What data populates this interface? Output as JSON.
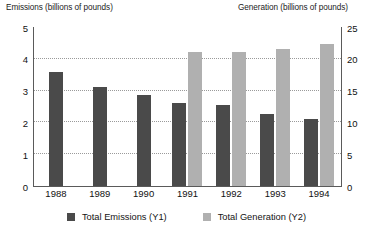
{
  "chart_data": {
    "type": "bar",
    "title": "",
    "subtitle": "",
    "categories": [
      "1988",
      "1989",
      "1990",
      "1991",
      "1992",
      "1993",
      "1994"
    ],
    "series": [
      {
        "name": "Total Emissions (Y1)",
        "axis": "left",
        "color": "#4a4a4a",
        "values": [
          3.6,
          3.1,
          2.85,
          2.6,
          2.55,
          2.25,
          2.1
        ]
      },
      {
        "name": "Total Generation (Y2)",
        "axis": "right",
        "color": "#b0b0b0",
        "values": [
          null,
          null,
          null,
          21,
          21,
          21.5,
          22.3
        ]
      }
    ],
    "xlabel": "",
    "ylabel": "Emissions (billions of pounds)",
    "y2label": "Generation (billions of pounds)",
    "ylim": [
      0,
      5
    ],
    "y2lim": [
      0,
      25
    ],
    "yticks": [
      "0",
      "1",
      "2",
      "3",
      "4",
      "5"
    ],
    "y2ticks": [
      "0",
      "5",
      "10",
      "15",
      "20",
      "25"
    ],
    "grid": true,
    "grid_style": "dotted",
    "legend_position": "bottom"
  },
  "axes": {
    "left_title": "Emissions (billions of pounds)",
    "right_title": "Generation (billions of pounds)"
  },
  "legend": {
    "entries": [
      {
        "label": "Total Emissions (Y1)",
        "color": "#4a4a4a"
      },
      {
        "label": "Total Generation (Y2)",
        "color": "#b0b0b0"
      }
    ]
  },
  "colors": {
    "emissions": "#4a4a4a",
    "generation": "#b0b0b0",
    "gridline": "#9a9a9a",
    "axis": "#5a5a5a",
    "text": "#111111",
    "background": "#ffffff"
  }
}
